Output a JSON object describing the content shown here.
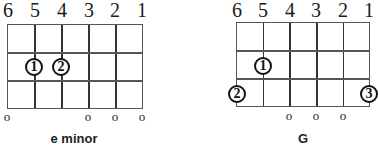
{
  "charts": [
    {
      "name": "e minor",
      "string_numbers": [
        "6",
        "5",
        "4",
        "3",
        "2",
        "1"
      ],
      "open_marker": "o",
      "open_strings": [
        "6",
        "3",
        "2",
        "1"
      ],
      "fingers": [
        {
          "label": "1",
          "string": "5",
          "fret": 2
        },
        {
          "label": "2",
          "string": "4",
          "fret": 2
        }
      ]
    },
    {
      "name": "G",
      "string_numbers": [
        "6",
        "5",
        "4",
        "3",
        "2",
        "1"
      ],
      "open_marker": "o",
      "open_strings": [
        "4",
        "3",
        "2"
      ],
      "fingers": [
        {
          "label": "1",
          "string": "5",
          "fret": 2
        },
        {
          "label": "2",
          "string": "6",
          "fret": 3
        },
        {
          "label": "3",
          "string": "1",
          "fret": 3
        }
      ]
    }
  ]
}
